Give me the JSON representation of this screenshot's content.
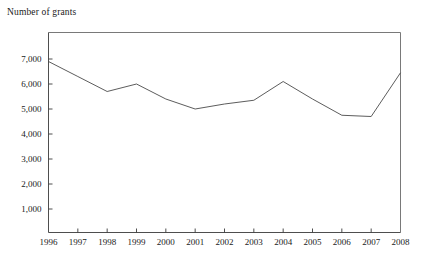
{
  "chart_data": {
    "type": "line",
    "title": "Number of grants",
    "xlabel": "",
    "ylabel": "",
    "grid": false,
    "legend": "none",
    "categories": [
      "1996",
      "1997",
      "1998",
      "1999",
      "2000",
      "2001",
      "2002",
      "2003",
      "2004",
      "2005",
      "2006",
      "2007",
      "2008"
    ],
    "x": [
      1996,
      1997,
      1998,
      1999,
      2000,
      2001,
      2002,
      2003,
      2004,
      2005,
      2006,
      2007,
      2008
    ],
    "values": [
      6900,
      6300,
      5700,
      6000,
      5400,
      5000,
      5200,
      5350,
      6100,
      5400,
      4750,
      4700,
      6450
    ],
    "series": [
      {
        "name": "Number of grants",
        "values": [
          6900,
          6300,
          5700,
          6000,
          5400,
          5000,
          5200,
          5350,
          6100,
          5400,
          4750,
          4700,
          6450
        ]
      }
    ],
    "xlim": [
      1996,
      2008
    ],
    "ylim": [
      0,
      8000
    ],
    "ytick_labels": [
      "1,000",
      "2,000",
      "3,000",
      "4,000",
      "5,000",
      "6,000",
      "7,000"
    ],
    "ytick_values": [
      1000,
      2000,
      3000,
      4000,
      5000,
      6000,
      7000
    ],
    "xtick_labels": [
      "1996",
      "1997",
      "1998",
      "1999",
      "2000",
      "2001",
      "2002",
      "2003",
      "2004",
      "2005",
      "2006",
      "2007",
      "2008"
    ],
    "line_color": "#4a4a4a",
    "axis_color": "#3a3a3a",
    "frame_color": "#6a6a6a",
    "background_color": "#ffffff"
  }
}
